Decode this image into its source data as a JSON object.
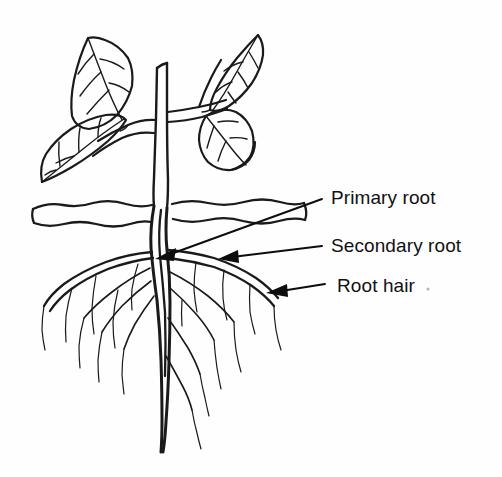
{
  "figure": {
    "background_color": "#fefefe",
    "ink_color": "#1a1a1a"
  },
  "labels": [
    {
      "id": "primary-root",
      "text": "Primary root",
      "arrow_from": [
        322,
        199
      ],
      "arrow_to": [
        156,
        258
      ]
    },
    {
      "id": "secondary-root",
      "text": "Secondary root",
      "arrow_from": [
        322,
        246
      ],
      "arrow_to": [
        219,
        259
      ]
    },
    {
      "id": "root-hair",
      "text": "Root hair",
      "arrow_from": [
        325,
        284
      ],
      "arrow_to": [
        266,
        293
      ]
    }
  ],
  "parts": {
    "shoot_label": "shoot system",
    "stem_label": "stem",
    "leaves_count": 4,
    "soil_label": "soil line",
    "taproot_label": "taproot"
  }
}
